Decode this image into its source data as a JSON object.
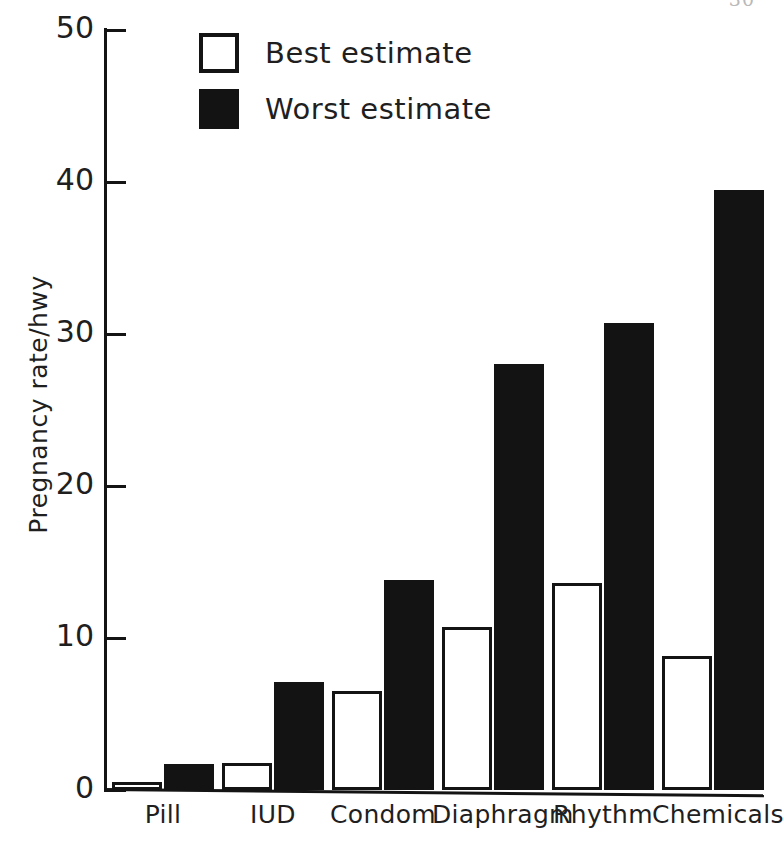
{
  "page_artifact": "30",
  "chart_data": {
    "type": "bar",
    "title": "",
    "xlabel": "",
    "ylabel": "Pregnancy rate/hwy",
    "categories": [
      "Pill",
      "IUD",
      "Condom",
      "Diaphragm",
      "Rhythm",
      "Chemicals"
    ],
    "series": [
      {
        "name": "Best estimate",
        "color": "#ffffff",
        "values": [
          0.5,
          1.8,
          6.5,
          10.7,
          13.6,
          8.8
        ]
      },
      {
        "name": "Worst estimate",
        "color": "#131313",
        "values": [
          1.7,
          7.1,
          13.8,
          28.0,
          30.7,
          39.5
        ]
      }
    ],
    "ylim": [
      0,
      50
    ],
    "yticks": [
      0,
      10,
      20,
      30,
      40,
      50
    ],
    "ytick_labels": [
      "0",
      "10",
      "20",
      "30",
      "40",
      "50"
    ],
    "grid": false,
    "legend_position": "top-left"
  },
  "legend": {
    "items": [
      {
        "label": "Best estimate",
        "swatch": "open-square-icon"
      },
      {
        "label": "Worst estimate",
        "swatch": "filled-square-icon"
      }
    ]
  }
}
